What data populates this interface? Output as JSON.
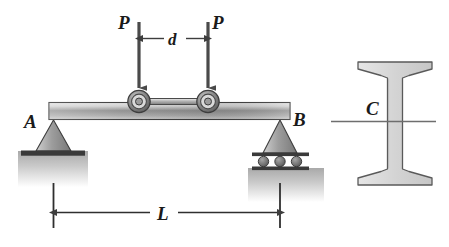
{
  "figure": {
    "background_color": "#ffffff"
  },
  "beam_diagram": {
    "labels": {
      "support_a": "A",
      "support_b": "B",
      "load_left": "P",
      "load_right": "P",
      "wheel_spacing": "d",
      "span": "L"
    },
    "colors": {
      "beam_light": "#e8e8e8",
      "beam_mid": "#8f8f8f",
      "beam_dark": "#6b6b6b",
      "outline": "#3a3a3a",
      "support_fill": "#9a9a9a",
      "ground": "#b5b5b5",
      "arrow": "#4a4a4a",
      "wheel_outer": "#6e6e6e",
      "wheel_inner": "#d5d5d5"
    },
    "elements": {
      "beam": "horizontal-beam",
      "support_a_type": "pin-support",
      "support_b_type": "roller-support",
      "roller_count": 3,
      "wheel_count": 2,
      "load_arrow_count": 2
    }
  },
  "cross_section": {
    "labels": {
      "centroid": "C"
    },
    "colors": {
      "section_fill": "#dcdcdc",
      "section_outline": "#5a5a5a",
      "axis_line": "#6e6e6e"
    },
    "shape": "wide-flange-I-beam-tapered-flanges"
  }
}
